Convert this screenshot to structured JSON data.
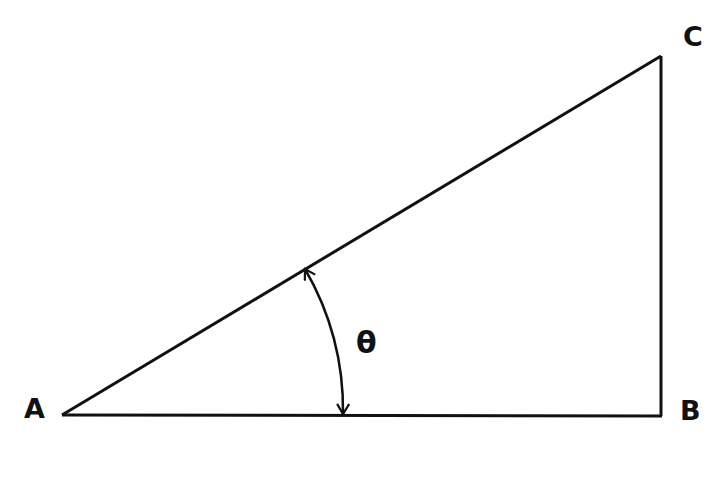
{
  "diagram": {
    "stroke_color": "#111111",
    "background": "#ffffff",
    "vertices": [
      {
        "id": "A",
        "label": "A",
        "x": 62,
        "y": 414
      },
      {
        "id": "B",
        "label": "B",
        "x": 661,
        "y": 416
      },
      {
        "id": "C",
        "label": "C",
        "x": 661,
        "y": 56
      }
    ],
    "sides": [
      {
        "from": "A",
        "to": "B",
        "name": "adjacent"
      },
      {
        "from": "B",
        "to": "C",
        "name": "opposite"
      },
      {
        "from": "A",
        "to": "C",
        "name": "hypotenuse"
      }
    ],
    "angle": {
      "vertex": "A",
      "label": "θ",
      "arc_radius": 282,
      "double_arrow": true
    }
  }
}
